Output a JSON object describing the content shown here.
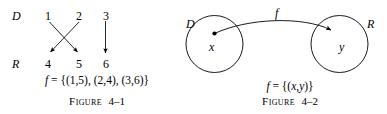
{
  "figures": [
    {
      "id": "figure-4-1",
      "caption_word": "Figure",
      "caption_number": "4–1",
      "domain_label": "D",
      "range_label": "R",
      "domain_elements": [
        "1",
        "2",
        "3"
      ],
      "range_elements": [
        "4",
        "5",
        "6"
      ],
      "formula": "f = {(1,5), (2,4), (3,6)}",
      "formula_func": "f",
      "formula_rest": " = {(1,5), (2,4), (3,6)}",
      "mappings": [
        {
          "from": "1",
          "to": "5"
        },
        {
          "from": "2",
          "to": "4"
        },
        {
          "from": "3",
          "to": "6"
        }
      ],
      "line_color": "#000000"
    },
    {
      "id": "figure-4-2",
      "caption_word": "Figure",
      "caption_number": "4–2",
      "domain_label": "D",
      "range_label": "R",
      "domain_element": "x",
      "range_element": "y",
      "function_label": "f",
      "formula": "f = {(x,y)}",
      "formula_func": "f",
      "formula_rest": " = {(",
      "formula_x": "x",
      "formula_comma": ",",
      "formula_y": "y",
      "formula_close": ")}",
      "line_color": "#000000"
    }
  ]
}
